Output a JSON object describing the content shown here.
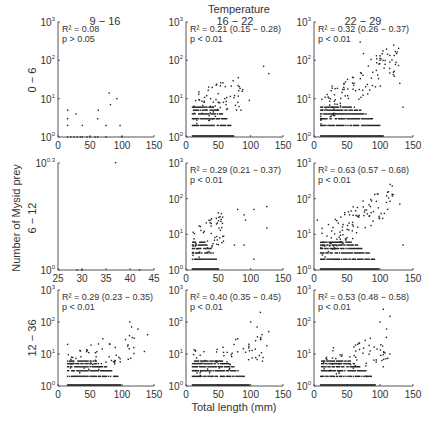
{
  "chart_data": {
    "type": "scatter",
    "title": "Temperature",
    "xlabel": "Total length (mm)",
    "ylabel": "Number of Mysid prey",
    "yscale": "log",
    "grid": false,
    "column_labels": [
      "9 - 16",
      "16 - 22",
      "22 - 29"
    ],
    "row_labels": [
      "0 - 6",
      "6 - 12",
      "12 - 36"
    ],
    "panels": [
      {
        "row": 0,
        "col": 0,
        "stats": "R² = 0.08",
        "p": "p > 0.05",
        "xlim": [
          0,
          150
        ],
        "ylim_exp": [
          0,
          3
        ],
        "xticks": [
          "0",
          "50",
          "100",
          "150"
        ],
        "yticks": [
          "10⁰",
          "10¹",
          "10²",
          "10³"
        ],
        "points": [
          [
            15,
            1
          ],
          [
            20,
            1
          ],
          [
            25,
            1
          ],
          [
            30,
            1
          ],
          [
            35,
            1
          ],
          [
            38,
            1
          ],
          [
            45,
            1
          ],
          [
            50,
            1
          ],
          [
            58,
            1
          ],
          [
            62,
            1
          ],
          [
            75,
            1
          ],
          [
            100,
            1
          ],
          [
            15,
            2
          ],
          [
            15,
            3
          ],
          [
            15,
            5
          ],
          [
            28,
            4
          ],
          [
            38,
            2
          ],
          [
            62,
            3
          ],
          [
            63,
            5
          ],
          [
            75,
            2
          ],
          [
            80,
            14
          ],
          [
            82,
            7
          ],
          [
            92,
            10
          ],
          [
            97,
            2
          ]
        ]
      },
      {
        "row": 0,
        "col": 1,
        "stats": "R² = 0.21 (0.15 − 0.28)",
        "p": "p < 0.01",
        "xlim": [
          0,
          150
        ],
        "ylim_exp": [
          0,
          3
        ],
        "xticks": [
          "0",
          "50",
          "100",
          "150"
        ],
        "yticks": [
          "10⁰",
          "10¹",
          "10²",
          "10³"
        ],
        "cluster": {
          "xmin": 10,
          "xmax": 90,
          "dense": "rows y=1..6"
        },
        "points": [
          [
            20,
            15
          ],
          [
            28,
            8
          ],
          [
            35,
            20
          ],
          [
            32,
            12
          ],
          [
            38,
            10
          ],
          [
            42,
            6
          ],
          [
            50,
            8
          ],
          [
            60,
            10
          ],
          [
            62,
            7
          ],
          [
            75,
            12
          ],
          [
            80,
            8
          ],
          [
            85,
            5
          ],
          [
            98,
            9
          ],
          [
            120,
            70
          ],
          [
            128,
            45
          ]
        ]
      },
      {
        "row": 0,
        "col": 2,
        "stats": "R² = 0.32 (0.26 − 0.37)",
        "p": "p < 0.01",
        "xlim": [
          0,
          150
        ],
        "ylim_exp": [
          0,
          3
        ],
        "xticks": [
          "0",
          "50",
          "100",
          "150"
        ],
        "yticks": [
          "10⁰",
          "10¹",
          "10²",
          "10³"
        ],
        "cluster": {
          "xmin": 10,
          "xmax": 130,
          "trend": "increasing"
        },
        "points": [
          [
            70,
            300
          ],
          [
            75,
            150
          ],
          [
            95,
            110
          ],
          [
            100,
            100
          ],
          [
            115,
            90
          ],
          [
            125,
            150
          ],
          [
            130,
            25
          ],
          [
            135,
            6
          ]
        ]
      },
      {
        "row": 1,
        "col": 0,
        "stats": "",
        "p": "",
        "xlim": [
          25,
          45
        ],
        "ylim_exp": [
          0,
          0.3
        ],
        "xticks": [
          "25",
          "30",
          "35",
          "40",
          "45"
        ],
        "yticks": [
          "10⁰",
          "10⁰·³"
        ],
        "points": [
          [
            29,
            1
          ],
          [
            30,
            1
          ],
          [
            37,
            2
          ],
          [
            42,
            1
          ]
        ]
      },
      {
        "row": 1,
        "col": 1,
        "stats": "R² = 0.29 (0.21 − 0.37)",
        "p": "p < 0.01",
        "xlim": [
          0,
          150
        ],
        "ylim_exp": [
          0,
          3
        ],
        "xticks": [
          "0",
          "50",
          "100",
          "150"
        ],
        "yticks": [
          "10⁰",
          "10¹",
          "10²",
          "10³"
        ],
        "cluster": {
          "xmin": 10,
          "xmax": 60
        },
        "points": [
          [
            50,
            40
          ],
          [
            80,
            50
          ],
          [
            90,
            35
          ],
          [
            92,
            25
          ],
          [
            105,
            50
          ],
          [
            125,
            60
          ],
          [
            125,
            15
          ],
          [
            75,
            5
          ],
          [
            90,
            5
          ],
          [
            105,
            2
          ]
        ]
      },
      {
        "row": 1,
        "col": 2,
        "stats": "R² = 0.63 (0.57 − 0.68)",
        "p": "p < 0.01",
        "xlim": [
          0,
          150
        ],
        "ylim_exp": [
          0,
          3
        ],
        "xticks": [
          "0",
          "50",
          "100",
          "150"
        ],
        "yticks": [
          "10⁰",
          "10¹",
          "10²",
          "10³"
        ],
        "cluster": {
          "xmin": 10,
          "xmax": 120,
          "trend": "increasing"
        },
        "points": [
          [
            5,
            25
          ],
          [
            110,
            120
          ],
          [
            120,
            130
          ],
          [
            130,
            70
          ],
          [
            135,
            5
          ]
        ]
      },
      {
        "row": 2,
        "col": 0,
        "stats": "R² = 0.29 (0.23 − 0.35)",
        "p": "p < 0.01",
        "xlim": [
          0,
          150
        ],
        "ylim_exp": [
          0,
          3
        ],
        "xticks": [
          "0",
          "50",
          "100",
          "150"
        ],
        "yticks": [
          "10⁰",
          "10¹",
          "10²",
          "10³"
        ],
        "cluster": {
          "xmin": 15,
          "xmax": 120
        },
        "points": [
          [
            15,
            20
          ],
          [
            70,
            30
          ],
          [
            112,
            100
          ],
          [
            115,
            70
          ],
          [
            125,
            60
          ],
          [
            140,
            40
          ],
          [
            135,
            12
          ]
        ]
      },
      {
        "row": 2,
        "col": 1,
        "stats": "R² = 0.40 (0.35 − 0.45)",
        "p": "p < 0.01",
        "xlim": [
          0,
          150
        ],
        "ylim_exp": [
          0,
          3
        ],
        "xticks": [
          "0",
          "50",
          "100",
          "150"
        ],
        "yticks": [
          "10⁰",
          "10¹",
          "10²",
          "10³"
        ],
        "cluster": {
          "xmin": 10,
          "xmax": 120
        },
        "points": [
          [
            115,
            200
          ],
          [
            100,
            100
          ],
          [
            110,
            70
          ],
          [
            128,
            50
          ],
          [
            125,
            18
          ],
          [
            80,
            30
          ]
        ]
      },
      {
        "row": 2,
        "col": 2,
        "stats": "R² = 0.53 (0.48 − 0.58)",
        "p": "p < 0.01",
        "xlim": [
          0,
          150
        ],
        "ylim_exp": [
          0,
          3
        ],
        "xticks": [
          "0",
          "50",
          "100",
          "150"
        ],
        "yticks": [
          "10⁰",
          "10¹",
          "10²",
          "10³"
        ],
        "cluster": {
          "xmin": 10,
          "xmax": 115
        },
        "points": [
          [
            105,
            250
          ],
          [
            115,
            150
          ],
          [
            100,
            100
          ],
          [
            110,
            60
          ],
          [
            115,
            10
          ],
          [
            105,
            4
          ],
          [
            80,
            2
          ]
        ]
      }
    ]
  },
  "labels": {
    "title": "Temperature",
    "xlabel": "Total length (mm)",
    "ylabel": "Number of Mysid prey",
    "col0": "9 − 16",
    "col1": "16 − 22",
    "col2": "22 − 29",
    "row0": "0 − 6",
    "row1": "6 − 12",
    "row2": "12 − 36"
  }
}
